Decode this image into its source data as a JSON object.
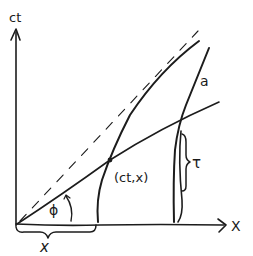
{
  "diagram": {
    "type": "spacetime-diagram",
    "axes": {
      "vertical_label": "ct",
      "horizontal_label": "X"
    },
    "labels": {
      "worldline": "a",
      "event": "(ct,x)",
      "angle": "ϕ",
      "distance": "x",
      "proper_time": "τ"
    },
    "elements": [
      {
        "name": "light-cone-dashed-line",
        "style": "dashed"
      },
      {
        "name": "hyperbolic-worldline",
        "label": "a"
      },
      {
        "name": "second-worldline"
      },
      {
        "name": "simultaneity-line",
        "angle": "ϕ"
      },
      {
        "name": "event-point",
        "label": "(ct,x)"
      }
    ],
    "colors": {
      "ink": "#1c1c1c",
      "background": "#ffffff"
    }
  }
}
